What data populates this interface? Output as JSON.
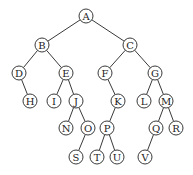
{
  "diagram": {
    "type": "binary-tree",
    "node_radius": 7,
    "colors": {
      "stroke": "#3a3a3a",
      "text": "#222222",
      "fill": "#ffffff",
      "background": "#ffffff"
    },
    "nodes": [
      {
        "id": "A",
        "label": "A",
        "x": 86,
        "y": 16
      },
      {
        "id": "B",
        "label": "B",
        "x": 42,
        "y": 45
      },
      {
        "id": "C",
        "label": "C",
        "x": 130,
        "y": 45
      },
      {
        "id": "D",
        "label": "D",
        "x": 19,
        "y": 73
      },
      {
        "id": "E",
        "label": "E",
        "x": 66,
        "y": 73
      },
      {
        "id": "F",
        "label": "F",
        "x": 105,
        "y": 73
      },
      {
        "id": "G",
        "label": "G",
        "x": 155,
        "y": 73
      },
      {
        "id": "H",
        "label": "H",
        "x": 30,
        "y": 101
      },
      {
        "id": "I",
        "label": "I",
        "x": 54,
        "y": 101
      },
      {
        "id": "J",
        "label": "J",
        "x": 76,
        "y": 101
      },
      {
        "id": "K",
        "label": "K",
        "x": 118,
        "y": 101
      },
      {
        "id": "L",
        "label": "L",
        "x": 144,
        "y": 101
      },
      {
        "id": "M",
        "label": "M",
        "x": 166,
        "y": 101
      },
      {
        "id": "N",
        "label": "N",
        "x": 66,
        "y": 128
      },
      {
        "id": "O",
        "label": "O",
        "x": 88,
        "y": 128
      },
      {
        "id": "P",
        "label": "P",
        "x": 107,
        "y": 128
      },
      {
        "id": "Q",
        "label": "Q",
        "x": 156,
        "y": 128
      },
      {
        "id": "R",
        "label": "R",
        "x": 176,
        "y": 128
      },
      {
        "id": "S",
        "label": "S",
        "x": 76,
        "y": 157
      },
      {
        "id": "T",
        "label": "T",
        "x": 97,
        "y": 157
      },
      {
        "id": "U",
        "label": "U",
        "x": 117,
        "y": 157
      },
      {
        "id": "V",
        "label": "V",
        "x": 145,
        "y": 157
      }
    ],
    "edges": [
      [
        "A",
        "B"
      ],
      [
        "A",
        "C"
      ],
      [
        "B",
        "D"
      ],
      [
        "B",
        "E"
      ],
      [
        "C",
        "F"
      ],
      [
        "C",
        "G"
      ],
      [
        "D",
        "H"
      ],
      [
        "E",
        "I"
      ],
      [
        "E",
        "J"
      ],
      [
        "F",
        "K"
      ],
      [
        "G",
        "L"
      ],
      [
        "G",
        "M"
      ],
      [
        "J",
        "N"
      ],
      [
        "J",
        "O"
      ],
      [
        "K",
        "P"
      ],
      [
        "M",
        "Q"
      ],
      [
        "M",
        "R"
      ],
      [
        "O",
        "S"
      ],
      [
        "P",
        "T"
      ],
      [
        "P",
        "U"
      ],
      [
        "Q",
        "V"
      ]
    ]
  }
}
